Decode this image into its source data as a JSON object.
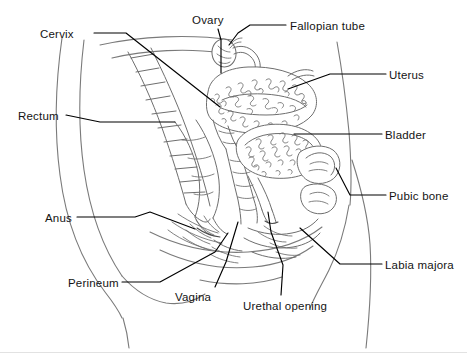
{
  "figure": {
    "background_color": "#ffffff",
    "line_color": "#6e6e6e",
    "leader_color": "#000000",
    "text_color": "#141414",
    "width": 467,
    "height": 353
  },
  "labels": [
    {
      "id": "cervix",
      "text": "Cervix",
      "side": "left",
      "x": 40,
      "y": 28
    },
    {
      "id": "ovary",
      "text": "Ovary",
      "side": "top",
      "x": 192,
      "y": 14
    },
    {
      "id": "fallopian_tube",
      "text": "Fallopian tube",
      "side": "top",
      "x": 290,
      "y": 20
    },
    {
      "id": "uterus",
      "text": "Uterus",
      "side": "right",
      "x": 389,
      "y": 69
    },
    {
      "id": "rectum",
      "text": "Rectum",
      "side": "left",
      "x": 18,
      "y": 110
    },
    {
      "id": "bladder",
      "text": "Bladder",
      "side": "right",
      "x": 385,
      "y": 129
    },
    {
      "id": "pubic_bone",
      "text": "Pubic bone",
      "side": "right",
      "x": 389,
      "y": 190
    },
    {
      "id": "anus",
      "text": "Anus",
      "side": "left",
      "x": 45,
      "y": 212
    },
    {
      "id": "labia_majora",
      "text": "Labia majora",
      "side": "right",
      "x": 385,
      "y": 259
    },
    {
      "id": "perineum",
      "text": "Perineum",
      "side": "left",
      "x": 68,
      "y": 277
    },
    {
      "id": "vagina",
      "text": "Vagina",
      "side": "bottom",
      "x": 175,
      "y": 291
    },
    {
      "id": "urethal_opening",
      "text": "Urethal opening",
      "side": "bottom",
      "x": 243,
      "y": 300
    }
  ],
  "leader_lines": [
    {
      "id": "leader-cervix",
      "label": "Cervix",
      "points": "94,33 126,33 220,107"
    },
    {
      "id": "leader-ovary",
      "label": "Ovary",
      "points": "218,29 221,40 221,73"
    },
    {
      "id": "leader-fallopian-tube",
      "label": "Fallopian tube",
      "points": "286,25 250,25 238,33 229,45"
    },
    {
      "id": "leader-uterus",
      "label": "Uterus",
      "points": "386,74 330,74 288,89"
    },
    {
      "id": "leader-rectum",
      "label": "Rectum",
      "points": "66,115 100,122 175,122"
    },
    {
      "id": "leader-bladder",
      "label": "Bladder",
      "points": "382,134 330,134 294,134"
    },
    {
      "id": "leader-pubic-bone",
      "label": "Pubic bone",
      "points": "386,195 350,195 336,168"
    },
    {
      "id": "leader-anus",
      "label": "Anus",
      "points": "77,217 135,217 150,212 195,229"
    },
    {
      "id": "leader-labia-majora",
      "label": "Labia majora",
      "points": "382,264 340,264 300,228"
    },
    {
      "id": "leader-perineum",
      "label": "Perineum",
      "points": "122,282 160,282 215,252 228,233"
    },
    {
      "id": "leader-vagina",
      "label": "Vagina",
      "points": "215,287 226,262 238,222"
    },
    {
      "id": "leader-urethal-opening",
      "label": "Urethal opening",
      "points": "281,295 283,265 271,232 268,212"
    }
  ]
}
